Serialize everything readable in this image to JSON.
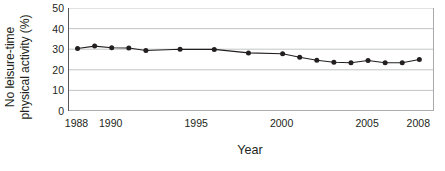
{
  "chart_data": {
    "type": "line",
    "title": "",
    "xlabel": "Year",
    "ylabel": "No leisure-time physical activity (%)",
    "ylabel_line1": "No leisure-time",
    "ylabel_line2": "physical activity (%)",
    "xlim": [
      1987.5,
      2008.8
    ],
    "ylim": [
      0,
      50
    ],
    "ytick_values": [
      50,
      40,
      30,
      20,
      10,
      0
    ],
    "ytick_labels": [
      "50",
      "40",
      "30",
      "20",
      "10",
      "0"
    ],
    "xtick_labels": [
      "1988",
      "1990",
      "1995",
      "2000",
      "2005",
      "2008"
    ],
    "xtick_label_values": [
      1988,
      1990,
      1995,
      2000,
      2005,
      2008
    ],
    "xtick_minor_step": 1,
    "grid": "horizontal",
    "legend": "none",
    "marker": "filled-circle",
    "line_color": "#231f20",
    "marker_color": "#231f20",
    "grid_color": "#bcbec0",
    "x": [
      1988,
      1989,
      1990,
      1991,
      1992,
      1994,
      1996,
      1998,
      2000,
      2001,
      2002,
      2003,
      2004,
      2005,
      2006,
      2007,
      2008
    ],
    "values": [
      30.3,
      31.5,
      30.7,
      30.6,
      29.4,
      30.0,
      29.9,
      28.2,
      27.8,
      26.1,
      24.6,
      23.7,
      23.4,
      24.5,
      23.4,
      23.4,
      25.0
    ],
    "series": [
      {
        "name": "No leisure-time physical activity (%)",
        "values": [
          30.3,
          31.5,
          30.7,
          30.6,
          29.4,
          30.0,
          29.9,
          28.2,
          27.8,
          26.1,
          24.6,
          23.7,
          23.4,
          24.5,
          23.4,
          23.4,
          25.0
        ]
      }
    ]
  }
}
